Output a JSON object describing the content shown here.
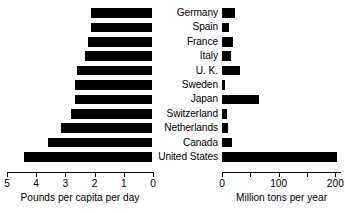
{
  "chart_data": {
    "type": "bar",
    "title": "",
    "orientation": "horizontal",
    "layout": "back-to-back dual panel (left mirrored, right normal)",
    "grid": false,
    "legend": false,
    "categories": [
      "Germany",
      "Spain",
      "France",
      "Italy",
      "U. K.",
      "Sweden",
      "Japan",
      "Switzerland",
      "Netherlands",
      "Canada",
      "United States"
    ],
    "panels": [
      {
        "id": "left",
        "xlabel": "Pounds per capita per day",
        "xlim": [
          5,
          0
        ],
        "reversed": true,
        "ticks": [
          5,
          4,
          3,
          2,
          1,
          0
        ],
        "tick_labels": [
          "5",
          "4",
          "3",
          "2",
          "1",
          "0"
        ],
        "values": [
          2.1,
          2.1,
          2.2,
          2.3,
          2.6,
          2.65,
          2.65,
          2.8,
          3.15,
          3.6,
          4.4
        ]
      },
      {
        "id": "right",
        "xlabel": "Million tons per year",
        "xlim": [
          0,
          210
        ],
        "reversed": false,
        "ticks": [
          0,
          50,
          100,
          150,
          200
        ],
        "tick_labels": [
          "0",
          "",
          "100",
          "",
          "200"
        ],
        "values": [
          23,
          12,
          20,
          16,
          32,
          5,
          65,
          9,
          11,
          17,
          205
        ]
      }
    ],
    "colors": {
      "bar": "#000000",
      "axis": "#000000",
      "background": "#ffffff",
      "text": "#000000"
    }
  }
}
